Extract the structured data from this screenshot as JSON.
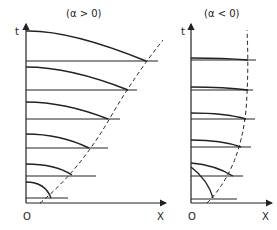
{
  "panels": [
    {
      "title": "(α > 0)",
      "y_axis_label": "t",
      "origin_label": "O",
      "x_axis_label": "X",
      "boundary_style": "dashed parabola-like curve moving right with t",
      "profiles": 6
    },
    {
      "title": "(α < 0)",
      "y_axis_label": "t",
      "origin_label": "O",
      "x_axis_label": "X",
      "boundary_style": "dashed curve approaching vertical asymptote",
      "profiles": 6
    }
  ],
  "colors": {
    "ink": "#222222",
    "background": "#ffffff"
  }
}
